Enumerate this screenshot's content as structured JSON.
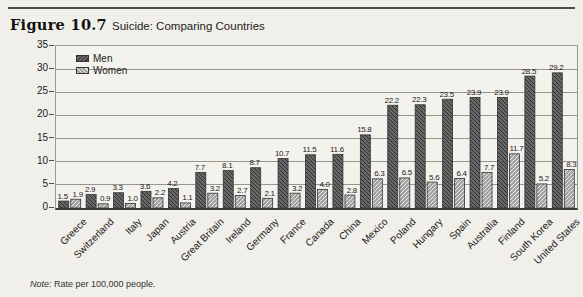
{
  "figure": {
    "label": "Figure 10.7",
    "title": "Suicide: Comparing Countries",
    "note_label": "Note:",
    "note_text": "Rate per 100,000 people."
  },
  "chart_data": {
    "type": "bar",
    "title": "Suicide: Comparing Countries",
    "figure_label": "Figure 10.7",
    "categories": [
      "Greece",
      "Switzerland",
      "Italy",
      "Japan",
      "Austria",
      "Great Britain",
      "Ireland",
      "Germany",
      "France",
      "Canada",
      "China",
      "Mexico",
      "Poland",
      "Hungary",
      "Spain",
      "Australia",
      "Finland",
      "South Korea",
      "United States"
    ],
    "series": [
      {
        "name": "Men",
        "values": [
          1.5,
          2.9,
          3.3,
          3.6,
          4.2,
          7.7,
          8.1,
          8.7,
          10.7,
          11.5,
          11.6,
          15.8,
          22.2,
          22.3,
          23.5,
          23.9,
          23.9,
          28.5,
          29.2
        ]
      },
      {
        "name": "Women",
        "values": [
          1.9,
          0.9,
          1.0,
          2.2,
          1.1,
          3.2,
          2.7,
          2.1,
          3.2,
          4.0,
          2.8,
          6.3,
          6.5,
          5.6,
          6.4,
          7.7,
          11.7,
          5.2,
          8.3
        ]
      }
    ],
    "ylabel": "",
    "xlabel": "",
    "ylim": [
      0,
      35
    ],
    "ytick_step": 5,
    "yticks": [
      0,
      5,
      10,
      15,
      20,
      25,
      30,
      35
    ],
    "grid": true,
    "bar_value_labels": true,
    "legend_position": "top-left",
    "note_label": "Note:",
    "note_text": "Rate per 100,000 people.",
    "colors": {
      "men_fill": "#686868",
      "men_hatch": "#2e2e2e",
      "women_fill": "#a2a2a2",
      "women_hatch": "#ececec",
      "grid": "#98958d",
      "axis": "#3a3a3a",
      "text": "#1a1a1a",
      "background": "#f1efe9"
    }
  }
}
